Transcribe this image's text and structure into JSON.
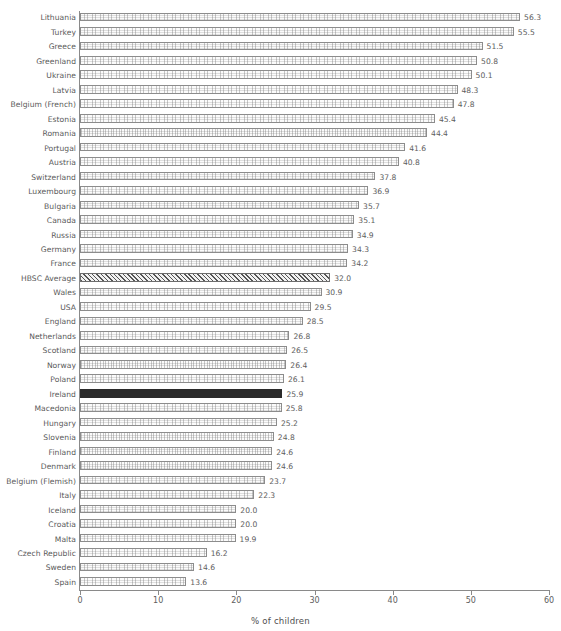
{
  "chart_data": {
    "type": "bar",
    "orientation": "horizontal",
    "title": "",
    "xlabel": "% of children",
    "ylabel": "",
    "xlim": [
      0,
      60
    ],
    "xticks": [
      0,
      10,
      20,
      30,
      40,
      50,
      60
    ],
    "grid": false,
    "legend": null,
    "value_format": "one-decimal",
    "categories": [
      "Lithuania",
      "Turkey",
      "Greece",
      "Greenland",
      "Ukraine",
      "Latvia",
      "Belgium (French)",
      "Estonia",
      "Romania",
      "Portugal",
      "Austria",
      "Switzerland",
      "Luxembourg",
      "Bulgaria",
      "Canada",
      "Russia",
      "Germany",
      "France",
      "HBSC Average",
      "Wales",
      "USA",
      "England",
      "Netherlands",
      "Scotland",
      "Norway",
      "Poland",
      "Ireland",
      "Macedonia",
      "Hungary",
      "Slovenia",
      "Finland",
      "Denmark",
      "Belgium (Flemish)",
      "Italy",
      "Iceland",
      "Croatia",
      "Malta",
      "Czech Republic",
      "Sweden",
      "Spain"
    ],
    "values": [
      56.3,
      55.5,
      51.5,
      50.8,
      50.1,
      48.3,
      47.8,
      45.4,
      44.4,
      41.6,
      40.8,
      37.8,
      36.9,
      35.7,
      35.1,
      34.9,
      34.3,
      34.2,
      32.0,
      30.9,
      29.5,
      28.5,
      26.8,
      26.5,
      26.4,
      26.1,
      25.9,
      25.8,
      25.2,
      24.8,
      24.6,
      24.6,
      23.7,
      22.3,
      20.0,
      20.0,
      19.9,
      16.2,
      14.6,
      13.6
    ],
    "value_labels": [
      "56.3",
      "55.5",
      "51.5",
      "50.8",
      "50.1",
      "48.3",
      "47.8",
      "45.4",
      "44.4",
      "41.6",
      "40.8",
      "37.8",
      "36.9",
      "35.7",
      "35.1",
      "34.9",
      "34.3",
      "34.2",
      "32.0",
      "30.9",
      "29.5",
      "28.5",
      "26.8",
      "26.5",
      "26.4",
      "26.1",
      "25.9",
      "25.8",
      "25.2",
      "24.8",
      "24.6",
      "24.6",
      "23.7",
      "22.3",
      "20.0",
      "20.0",
      "19.9",
      "16.2",
      "14.6",
      "13.6"
    ],
    "tick_labels": [
      "0",
      "10",
      "20",
      "30",
      "40",
      "50",
      "60"
    ],
    "styles": {
      "default_bar_fill": "#fbfbfb",
      "default_bar_edge": "#8c8c8c",
      "highlight_bar_fill": "#2b2b2b",
      "average_bar_hatch": "#555555",
      "axis_color": "#8a8a8a",
      "text_color": "#5a5a5a"
    },
    "special_series": {
      "highlight_category": "Ireland",
      "average_category": "HBSC Average"
    }
  }
}
